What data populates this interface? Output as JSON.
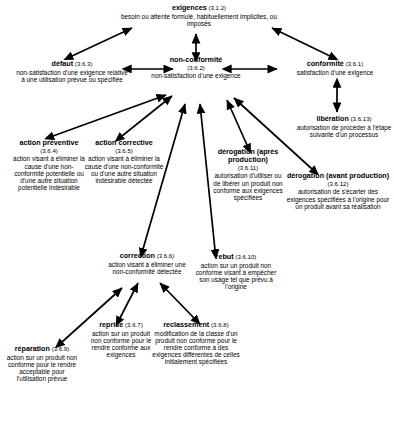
{
  "diagram": {
    "line_color": "#000000",
    "background": "#ffffff",
    "nodes": [
      {
        "id": "exigences",
        "term": "exigences",
        "ref": "(3.1.2)",
        "definition": "besoin ou attente formulé, habituellement implicites, ou imposés"
      },
      {
        "id": "defaut",
        "term": "défaut",
        "ref": "(3.6.3)",
        "definition": "non-satisfaction d'une exigence relative à une utilisation prévue ou spécifiée"
      },
      {
        "id": "non-conformite",
        "term": "non-conformité",
        "ref": "(3.6.2)",
        "definition": "non-satisfaction d'une exigence"
      },
      {
        "id": "conformite",
        "term": "conformité",
        "ref": "(3.6.1)",
        "definition": "satisfaction d'une exigence"
      },
      {
        "id": "liberation",
        "term": "libération",
        "ref": "(3.6.13)",
        "definition": "autorisation de procéder à l'étape suivante d'un processus"
      },
      {
        "id": "derogation-avant-production",
        "term": "dérogation (avant production)",
        "ref": "(3.6.12)",
        "definition": "autorisation de s'écarter des exigences spécifiées à l'origine pour un produit avant sa réalisation"
      },
      {
        "id": "derogation-apres-production",
        "term": "dérogation (après production)",
        "ref": "(3.6.11)",
        "definition": "autorisation d'utiliser ou de libérer un produit non conforme aux exigences spécifiées"
      },
      {
        "id": "action-preventive",
        "term": "action préventive",
        "ref": "(3.6.4)",
        "definition": "action visant à éliminer la cause d'une non-conformité potentielle ou d'une autre situation potentielle indésirable"
      },
      {
        "id": "action-corrective",
        "term": "action corrective",
        "ref": "(3.6.5)",
        "definition": "action visant à éliminer la cause d'une non-conformité ou d'une autre situation indésirable détectée"
      },
      {
        "id": "correction",
        "term": "correction",
        "ref": "(3.6.6)",
        "definition": "action visant à éliminer une non-conformité détectée"
      },
      {
        "id": "rebut",
        "term": "rebut",
        "ref": "(3.6.10)",
        "definition": "action sur un produit non conforme visant à empêcher son usage tel que prévu à l'origine"
      },
      {
        "id": "reprise",
        "term": "reprise",
        "ref": "(3.6.7)",
        "definition": "action sur un produit non conforme pour le rendre conforme aux exigences"
      },
      {
        "id": "reclassement",
        "term": "reclassement",
        "ref": "(3.6.8)",
        "definition": "modification de la classe d'un produit non conforme pour le rendre conforme à des exigences différentes de celles initialement spécifiées"
      },
      {
        "id": "reparation",
        "term": "réparation",
        "ref": "(3.6.9)",
        "definition": "action sur un produit non conforme pour le rendre acceptable pour l'utilisation prévue"
      }
    ],
    "edges": [
      {
        "from": "non-conformite",
        "to": "exigences",
        "style": "double"
      },
      {
        "from": "defaut",
        "to": "exigences",
        "style": "double"
      },
      {
        "from": "conformite",
        "to": "exigences",
        "style": "double"
      },
      {
        "from": "defaut",
        "to": "non-conformite",
        "style": "double"
      },
      {
        "from": "non-conformite",
        "to": "conformite",
        "style": "double"
      },
      {
        "from": "conformite",
        "to": "liberation",
        "style": "double"
      },
      {
        "from": "action-preventive",
        "to": "non-conformite",
        "style": "double"
      },
      {
        "from": "action-corrective",
        "to": "non-conformite",
        "style": "double"
      },
      {
        "from": "correction",
        "to": "non-conformite",
        "style": "double"
      },
      {
        "from": "rebut",
        "to": "non-conformite",
        "style": "double"
      },
      {
        "from": "derogation-apres-production",
        "to": "non-conformite",
        "style": "double"
      },
      {
        "from": "derogation-avant-production",
        "to": "non-conformite",
        "style": "double"
      },
      {
        "from": "reprise",
        "to": "correction",
        "style": "double"
      },
      {
        "from": "reclassement",
        "to": "correction",
        "style": "double"
      },
      {
        "from": "reparation",
        "to": "correction",
        "style": "double"
      }
    ]
  }
}
